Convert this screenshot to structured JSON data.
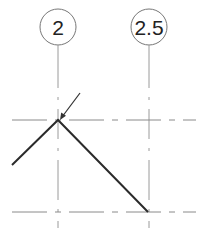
{
  "drawing": {
    "grids": [
      {
        "label": "2",
        "x": 58,
        "bubble_cy": 27,
        "bubble_r": 18
      },
      {
        "label": "2.5",
        "x": 149,
        "bubble_cy": 27,
        "bubble_r": 18
      }
    ],
    "levels": [
      {
        "y": 120
      },
      {
        "y": 212
      }
    ],
    "colors": {
      "grid_line": "#9a9a9a",
      "bubble_stroke": "#777777",
      "level_line": "#8a8a8a",
      "polyline": "#2b2b2b",
      "arrow": "#333333",
      "text": "#222222"
    }
  }
}
